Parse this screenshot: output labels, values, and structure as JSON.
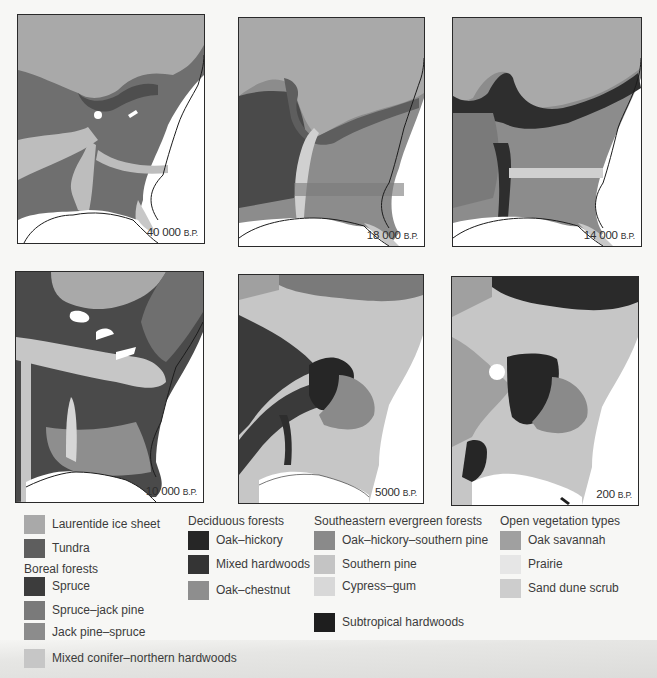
{
  "figure": {
    "maps": [
      {
        "age_number": "40 000",
        "age_unit": "B.P."
      },
      {
        "age_number": "18 000",
        "age_unit": "B.P."
      },
      {
        "age_number": "14 000",
        "age_unit": "B.P."
      },
      {
        "age_number": "10 000",
        "age_unit": "B.P."
      },
      {
        "age_number": "5000",
        "age_unit": "B.P."
      },
      {
        "age_number": "200",
        "age_unit": "B.P."
      }
    ],
    "legend": {
      "ungrouped": [
        {
          "label": "Laurentide ice sheet",
          "color": "#a9a9a9"
        },
        {
          "label": "Tundra",
          "color": "#5e5e5e"
        }
      ],
      "boreal": {
        "heading": "Boreal forests",
        "items": [
          {
            "label": "Spruce",
            "color": "#3c3c3c"
          },
          {
            "label": "Spruce–jack pine",
            "color": "#7a7a7a"
          },
          {
            "label": "Jack pine–spruce",
            "color": "#8c8c8c"
          },
          {
            "label": "Mixed conifer–northern hardwoods",
            "color": "#c6c6c6"
          }
        ]
      },
      "deciduous": {
        "heading": "Deciduous forests",
        "items": [
          {
            "label": "Oak–hickory",
            "color": "#262626"
          },
          {
            "label": "Mixed hardwoods",
            "color": "#343434"
          },
          {
            "label": "Oak–chestnut",
            "color": "#8e8e8e"
          }
        ]
      },
      "southeastern": {
        "heading": "Southeastern evergreen forests",
        "items": [
          {
            "label": "Oak–hickory–southern pine",
            "color": "#8a8a8a"
          },
          {
            "label": "Southern pine",
            "color": "#c4c4c4"
          },
          {
            "label": "Cypress–gum",
            "color": "#d8d8d8"
          },
          {
            "label": "Subtropical hardwoods",
            "color": "#1e1e1e"
          }
        ]
      },
      "open": {
        "heading": "Open vegetation types",
        "items": [
          {
            "label": "Oak savannah",
            "color": "#a0a0a0"
          },
          {
            "label": "Prairie",
            "color": "#e6e6e6"
          },
          {
            "label": "Sand dune scrub",
            "color": "#cdcdcd"
          }
        ]
      }
    }
  }
}
